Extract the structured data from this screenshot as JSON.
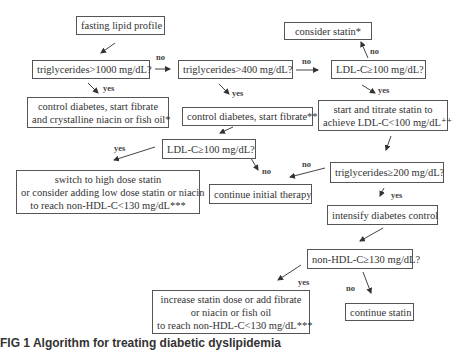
{
  "nodes": {
    "fasting": "fasting lipid profile",
    "tg1000": "triglycerides>1000 mg/dL?",
    "tg400": "triglycerides>400 mg/dL?",
    "ldl100_top": "LDL-C≥100 mg/dL?",
    "consider_statin": "consider statin*",
    "control_fibrate_niacin": [
      "control diabetes, start fibrate",
      "and crystalline niacin or fish oil*"
    ],
    "control_fibrate": "control diabetes, start fibrate**",
    "start_titrate": [
      "start and titrate statin to",
      "achieve LDL-C<100 mg/dL⁺⁺"
    ],
    "ldl100_mid": "LDL-C≥100 mg/dL?",
    "switch_high_dose": [
      "switch to high dose statin",
      "or consider adding low dose statin or niacin",
      "to reach non-HDL-C<130 mg/dL***"
    ],
    "continue_initial": "continue initial therapy",
    "tg200": "triglycerides≥200 mg/dL?",
    "intensify": "intensify diabetes control",
    "nonhdl130": "non-HDL-C≥130 mg/dL?",
    "increase_statin": [
      "increase statin dose or add fibrate",
      "or niacin or fish oil",
      "to reach non-HDL-C<130 mg/dL***"
    ],
    "continue_statin": "continue statin"
  },
  "labels": {
    "yes": "yes",
    "no": "no"
  },
  "caption": "FIG 1  Algorithm for treating diabetic dyslipidemia"
}
